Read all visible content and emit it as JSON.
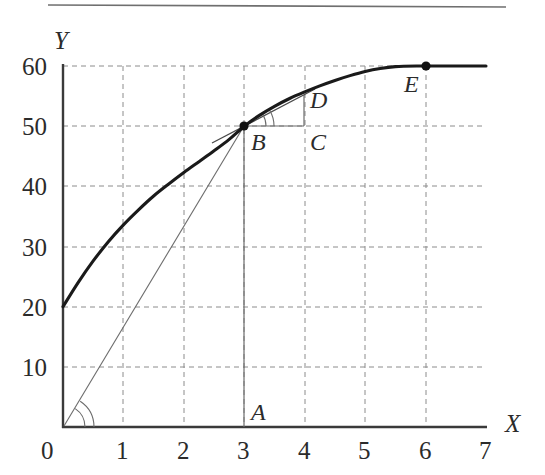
{
  "figure": {
    "background_color": "#ffffff",
    "rule_color": "#6f6f6f",
    "axis_color": "#3a3a3a",
    "grid_color": "#8c8c8c",
    "curve_color": "#1a1a1a",
    "thin_line_color": "#6b6b6b",
    "text_color": "#2b2b2b",
    "has_top_rule": true
  },
  "chart_data": {
    "type": "line",
    "title": "",
    "subtitle": "",
    "xlabel": "X",
    "ylabel": "Y",
    "xlim": [
      0,
      7
    ],
    "ylim": [
      0,
      60
    ],
    "xticks": [
      0,
      1,
      2,
      3,
      4,
      5,
      6,
      7
    ],
    "xtick_labels": [
      "0",
      "1",
      "2",
      "3",
      "4",
      "5",
      "6",
      "7"
    ],
    "yticks": [
      10,
      20,
      30,
      40,
      50,
      60
    ],
    "ytick_labels": [
      "10",
      "20",
      "30",
      "40",
      "50",
      "60"
    ],
    "grid": true,
    "grid_style": "dashed",
    "legend": "none",
    "series": [
      {
        "name": "total-product-curve",
        "style": "thick-solid",
        "x": [
          0.0,
          0.25,
          0.5,
          0.75,
          1.0,
          1.25,
          1.5,
          1.75,
          2.0,
          2.25,
          2.5,
          2.75,
          3.0,
          3.25,
          3.5,
          3.75,
          4.0,
          4.25,
          4.5,
          4.75,
          5.0,
          5.25,
          5.5,
          5.85,
          6.25,
          6.6,
          7.0
        ],
        "y": [
          20.0,
          24.0,
          27.6,
          30.8,
          33.6,
          36.1,
          38.4,
          40.4,
          42.3,
          44.1,
          45.9,
          47.8,
          50.0,
          51.8,
          53.3,
          54.6,
          55.7,
          56.7,
          57.6,
          58.4,
          59.1,
          59.6,
          59.9,
          60.0,
          60.0,
          60.0,
          60.0
        ]
      },
      {
        "name": "ray-from-origin-to-B",
        "style": "thin-solid",
        "x": [
          0,
          3
        ],
        "y": [
          0,
          50
        ]
      },
      {
        "name": "tangent-at-B",
        "style": "thin-solid",
        "x": [
          2.45,
          4.15
        ],
        "y": [
          45.6,
          56.9
        ]
      }
    ],
    "annotations": [
      {
        "label": "A",
        "x": 3.0,
        "y": 0.0,
        "label_dx": 9,
        "label_dy": -12,
        "marker": false,
        "note": "foot of perpendicular from B on X axis"
      },
      {
        "label": "B",
        "x": 3.0,
        "y": 50.0,
        "label_dx": 9,
        "label_dy": 20,
        "marker": true,
        "note": "point on curve where tangent is drawn"
      },
      {
        "label": "C",
        "x": 4.0,
        "y": 50.0,
        "label_dx": 7,
        "label_dy": 20,
        "marker": false,
        "note": "right angle corner of tangent triangle"
      },
      {
        "label": "D",
        "x": 4.0,
        "y": 55.2,
        "label_dx": 7,
        "label_dy": 1,
        "marker": false,
        "note": "tangent line point above C"
      },
      {
        "label": "E",
        "x": 5.85,
        "y": 60.0,
        "label_dx": 5,
        "label_dy": 22,
        "marker": true,
        "note": "maximum of the curve"
      }
    ],
    "segments": [
      {
        "name": "BA-vertical",
        "from": [
          3.0,
          50.0
        ],
        "to": [
          3.0,
          0.0
        ],
        "style": "thin-solid"
      },
      {
        "name": "BC-horizontal",
        "from": [
          3.0,
          50.0
        ],
        "to": [
          4.0,
          50.0
        ],
        "style": "thin-solid"
      },
      {
        "name": "CD-vertical",
        "from": [
          4.0,
          50.0
        ],
        "to": [
          4.0,
          55.2
        ],
        "style": "thin-solid"
      }
    ],
    "angle_arcs": [
      {
        "name": "angle-at-origin",
        "vertex": [
          0,
          0
        ],
        "count": 2,
        "note": "angle between X axis and ray OB"
      },
      {
        "name": "angle-at-B",
        "vertex": [
          3.0,
          50.0
        ],
        "count": 2,
        "note": "angle between BC and tangent BD"
      }
    ]
  }
}
